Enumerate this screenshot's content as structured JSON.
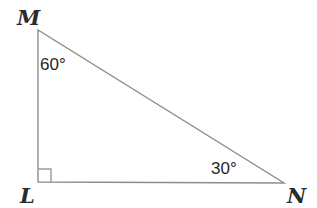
{
  "figure": {
    "background_color": "#ffffff",
    "stroke_color": "#8d8d8d",
    "label_color": "#2b2b2b",
    "angle_label_color": "#272727",
    "width": 317,
    "height": 208
  },
  "vertices": {
    "M": {
      "label": "M",
      "x": 38,
      "y": 30
    },
    "L": {
      "label": "L",
      "x": 38,
      "y": 182
    },
    "N": {
      "label": "N",
      "x": 284,
      "y": 183
    }
  },
  "angles": {
    "at_M": "60°",
    "at_N": "30°",
    "at_L": "right-angle-marker"
  },
  "sides": {
    "ML": "left vertical leg",
    "LN": "bottom horizontal leg",
    "MN": "hypotenuse"
  },
  "geometry": {
    "path_triangle": "M 38 30 L 38 182 L 284 183 Z",
    "path_right_angle": "M 38 169 L 51 169 L 51 182"
  }
}
